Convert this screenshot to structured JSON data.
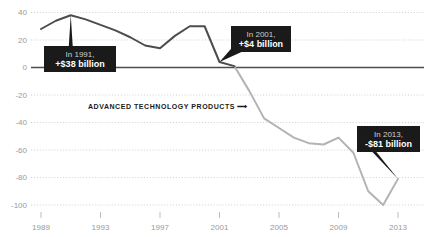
{
  "chart_data": {
    "type": "line",
    "title": "",
    "subtitle": "",
    "xlabel": "",
    "ylabel": "",
    "xlim": [
      1989,
      2013
    ],
    "ylim": [
      -100,
      40
    ],
    "grid": true,
    "legend_position": "inline-annotation",
    "series_label": "ADVANCED TECHNOLOGY PRODUCTS ⟶",
    "yticks": [
      40,
      20,
      0,
      -20,
      -40,
      -60,
      -80,
      -100
    ],
    "ytick_labels": [
      "40",
      "20",
      "0",
      "-20",
      "-40",
      "-60",
      "-80",
      "-100"
    ],
    "xticks": [
      1989,
      1993,
      1997,
      2001,
      2005,
      2009,
      2013
    ],
    "xtick_labels": [
      "1989",
      "1993",
      "1997",
      "2001",
      "2005",
      "2009",
      "2013"
    ],
    "zero_line": 0,
    "series": [
      {
        "name": "Advanced Technology Products trade balance ($ billions)",
        "x": [
          1989,
          1990,
          1991,
          1992,
          1993,
          1994,
          1995,
          1996,
          1997,
          1998,
          1999,
          2000,
          2001,
          2002,
          2003,
          2004,
          2005,
          2006,
          2007,
          2008,
          2009,
          2010,
          2011,
          2012,
          2013
        ],
        "values": [
          28,
          34,
          38,
          35,
          31,
          27,
          22,
          16,
          14,
          23,
          30,
          30,
          4,
          1,
          -17,
          -37,
          -44,
          -51,
          -55,
          -56,
          -51,
          -62,
          -90,
          -100,
          -81
        ]
      }
    ],
    "annotations": [
      {
        "id": "callout-1991",
        "line1": "In 1991,",
        "line2": "+$38 billion",
        "x_year": 1991,
        "y_value": 38,
        "box": {
          "x": 44,
          "y": 46,
          "w": 72,
          "h": 26
        },
        "pointer": "up"
      },
      {
        "id": "callout-2001",
        "line1": "In 2001,",
        "line2": "+$4 billion",
        "x_year": 2001,
        "y_value": 4,
        "box": {
          "x": 231,
          "y": 26,
          "w": 60,
          "h": 26
        },
        "pointer": "down-left"
      },
      {
        "id": "callout-2013",
        "line1": "In 2013,",
        "line2": "-$81 billion",
        "x_year": 2013,
        "y_value": -81,
        "box": {
          "x": 357,
          "y": 126,
          "w": 63,
          "h": 26
        },
        "pointer": "down-left"
      }
    ],
    "colors": {
      "line_positive": "#4d4d4d",
      "line_negative": "#b3b3b3",
      "zero_axis": "#4d4d4d",
      "gridline": "#c9c9c9",
      "tick_text": "#9a9a9a",
      "callout_bg": "#1a1a1a",
      "callout_text": "#ffffff",
      "callout_subtext": "#cfcfcf",
      "background": "#ffffff"
    }
  }
}
